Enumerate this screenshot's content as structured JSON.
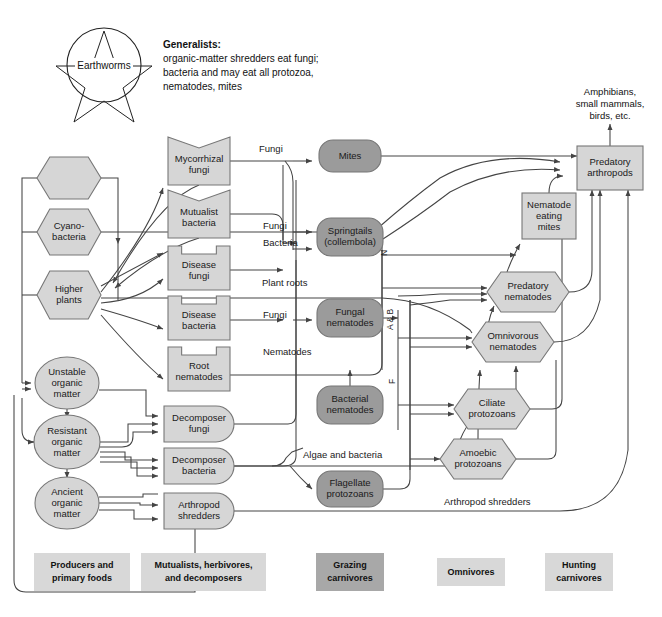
{
  "diagram": {
    "note": {
      "heading": "Generalists:",
      "lines": [
        "organic-matter shredders eat fungi;",
        "bacteria and may eat all protozoa,",
        "nematodes, mites"
      ]
    },
    "earthworms": {
      "label": "Earthworms"
    },
    "external_output": {
      "lines": [
        "Amphibians,",
        "small mammals,",
        "birds, etc."
      ]
    }
  },
  "colors": {
    "light": "#d6d6d6",
    "dark": "#9b9b9b",
    "stroke": "#777777",
    "edge": "#444444",
    "legend_light": "#d8d8d8",
    "legend_dark": "#a8a8a8",
    "text": "#1a1a1a"
  },
  "nodes": {
    "algae": {
      "label": "Algae",
      "shape": "hexagon",
      "tone": "light",
      "x": 69,
      "y": 178,
      "w": 64,
      "h": 42
    },
    "cyanobacteria": {
      "label": "Cyano-\nbacteria",
      "line1": "Cyano-",
      "line2": "bacteria",
      "shape": "hexagon",
      "tone": "light",
      "x": 69,
      "y": 232,
      "w": 64,
      "h": 46
    },
    "higher_plants": {
      "label": "Higher plants",
      "line1": "Higher",
      "line2": "plants",
      "shape": "hexagon",
      "tone": "light",
      "x": 69,
      "y": 295,
      "w": 64,
      "h": 48
    },
    "unstable_om": {
      "label": "Unstable organic matter",
      "line1": "Unstable",
      "line2": "organic",
      "line3": "matter",
      "shape": "ellipse",
      "tone": "light",
      "x": 67,
      "y": 383,
      "w": 64,
      "h": 52
    },
    "resistant_om": {
      "label": "Resistant organic matter",
      "line1": "Resistant",
      "line2": "organic",
      "line3": "matter",
      "shape": "ellipse",
      "tone": "light",
      "x": 67,
      "y": 442,
      "w": 66,
      "h": 54
    },
    "ancient_om": {
      "label": "Ancient organic matter",
      "line1": "Ancient",
      "line2": "organic",
      "line3": "matter",
      "shape": "ellipse",
      "tone": "light",
      "x": 67,
      "y": 503,
      "w": 64,
      "h": 52
    },
    "mycorrhizal_fungi": {
      "label": "Mycorrhizal fungi",
      "line1": "Mycorrhizal",
      "line2": "fungi",
      "shape": "vnotch",
      "tone": "light",
      "x": 199,
      "y": 161,
      "w": 62,
      "h": 48
    },
    "mutualist_bacteria": {
      "label": "Mutualist bacteria",
      "line1": "Mutualist",
      "line2": "bacteria",
      "shape": "vnotch",
      "tone": "light",
      "x": 199,
      "y": 214,
      "w": 62,
      "h": 48
    },
    "disease_fungi": {
      "label": "Disease fungi",
      "line1": "Disease",
      "line2": "fungi",
      "shape": "tabnotch",
      "tone": "light",
      "x": 199,
      "y": 268,
      "w": 62,
      "h": 44
    },
    "disease_bacteria": {
      "label": "Disease bacteria",
      "line1": "Disease",
      "line2": "bacteria",
      "shape": "tabnotch",
      "tone": "light",
      "x": 199,
      "y": 318,
      "w": 62,
      "h": 44
    },
    "root_nematodes": {
      "label": "Root nematodes",
      "line1": "Root",
      "line2": "nematodes",
      "shape": "tabnotch",
      "tone": "light",
      "x": 199,
      "y": 369,
      "w": 62,
      "h": 44
    },
    "decomposer_fungi": {
      "label": "Decomposer fungi",
      "line1": "Decomposer",
      "line2": "fungi",
      "shape": "dround",
      "tone": "light",
      "x": 199,
      "y": 424,
      "w": 70,
      "h": 36
    },
    "decomposer_bacteria": {
      "label": "Decomposer bacteria",
      "line1": "Decomposer",
      "line2": "bacteria",
      "shape": "dround",
      "tone": "light",
      "x": 199,
      "y": 466,
      "w": 70,
      "h": 36
    },
    "arthropod_shredders": {
      "label": "Arthropod shredders",
      "line1": "Arthropod",
      "line2": "shredders",
      "shape": "dround",
      "tone": "light",
      "x": 199,
      "y": 511,
      "w": 70,
      "h": 36
    },
    "mites": {
      "label": "Mites",
      "line1": "Mites",
      "shape": "rounded",
      "tone": "dark",
      "x": 350,
      "y": 156,
      "w": 62,
      "h": 32
    },
    "springtails": {
      "label": "Springtails (collembola)",
      "line1": "Springtails",
      "line2": "(collembola)",
      "shape": "rounded",
      "tone": "dark",
      "x": 350,
      "y": 237,
      "w": 66,
      "h": 38
    },
    "fungal_nematodes": {
      "label": "Fungal nematodes",
      "line1": "Fungal",
      "line2": "nematodes",
      "shape": "rounded",
      "tone": "dark",
      "x": 350,
      "y": 318,
      "w": 66,
      "h": 38
    },
    "bacterial_nematodes": {
      "label": "Bacterial nematodes",
      "line1": "Bacterial",
      "line2": "nematodes",
      "shape": "rounded",
      "tone": "dark",
      "x": 350,
      "y": 405,
      "w": 66,
      "h": 38
    },
    "flagellate_protozoans": {
      "label": "Flagellate protozoans",
      "line1": "Flagellate",
      "line2": "protozoans",
      "shape": "rounded",
      "tone": "dark",
      "x": 350,
      "y": 489,
      "w": 66,
      "h": 36
    },
    "ciliate_protozoans": {
      "label": "Ciliate protozoans",
      "line1": "Ciliate",
      "line2": "protozoans",
      "shape": "hexagon",
      "tone": "light",
      "x": 492,
      "y": 409,
      "w": 76,
      "h": 40
    },
    "amoebic_protozoans": {
      "label": "Amoebic protozoans",
      "line1": "Amoebic",
      "line2": "protozoans",
      "shape": "hexagon",
      "tone": "light",
      "x": 478,
      "y": 459,
      "w": 76,
      "h": 40
    },
    "omnivorous_nematodes": {
      "label": "Omnivorous nematodes",
      "line1": "Omnivorous",
      "line2": "nematodes",
      "shape": "hexagon",
      "tone": "light",
      "x": 513,
      "y": 342,
      "w": 82,
      "h": 40
    },
    "predatory_nematodes": {
      "label": "Predatory nematodes",
      "line1": "Predatory",
      "line2": "nematodes",
      "shape": "hexagon",
      "tone": "light",
      "x": 528,
      "y": 292,
      "w": 82,
      "h": 40
    },
    "nematode_eating_mites": {
      "label": "Nematode eating mites",
      "line1": "Nematode",
      "line2": "eating",
      "line3": "mites",
      "shape": "rect",
      "tone": "light",
      "x": 549,
      "y": 216,
      "w": 54,
      "h": 46
    },
    "predatory_arthropods": {
      "label": "Predatory arthropods",
      "line1": "Predatory",
      "line2": "arthropods",
      "shape": "rect",
      "tone": "light",
      "x": 610,
      "y": 168,
      "w": 66,
      "h": 44
    }
  },
  "edge_labels": [
    {
      "text": "Fungi",
      "x": 259,
      "y": 152
    },
    {
      "text": "Fungi",
      "x": 263,
      "y": 229
    },
    {
      "text": "Bacteria",
      "x": 263,
      "y": 246
    },
    {
      "text": "Plant roots",
      "x": 262,
      "y": 286
    },
    {
      "text": "Fungi",
      "x": 263,
      "y": 318
    },
    {
      "text": "Nematodes",
      "x": 263,
      "y": 355
    },
    {
      "text": "Algae and bacteria",
      "x": 303,
      "y": 458
    },
    {
      "text": "Arthropod shredders",
      "x": 444,
      "y": 505
    }
  ],
  "rotated_labels": [
    {
      "text": "N",
      "x": 387,
      "y": 256
    },
    {
      "text": "A & B",
      "x": 393,
      "y": 330
    },
    {
      "text": "F",
      "x": 395,
      "y": 384
    }
  ],
  "legend": [
    {
      "id": "producers",
      "line1": "Producers and",
      "line2": "primary foods",
      "tone": "light",
      "x": 34,
      "y": 553,
      "w": 96,
      "h": 38
    },
    {
      "id": "mutualists",
      "line1": "Mutualists, herbivores,",
      "line2": "and decomposers",
      "tone": "light",
      "x": 141,
      "y": 553,
      "w": 125,
      "h": 38
    },
    {
      "id": "grazing",
      "line1": "Grazing",
      "line2": "carnivores",
      "tone": "dark",
      "x": 316,
      "y": 553,
      "w": 68,
      "h": 38
    },
    {
      "id": "omnivores",
      "line1": "Omnivores",
      "line2": "",
      "tone": "light",
      "x": 437,
      "y": 558,
      "w": 68,
      "h": 28
    },
    {
      "id": "hunting",
      "line1": "Hunting",
      "line2": "carnivores",
      "tone": "light",
      "x": 545,
      "y": 553,
      "w": 68,
      "h": 38
    }
  ]
}
